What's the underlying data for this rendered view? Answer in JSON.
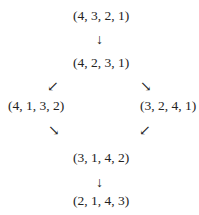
{
  "nodes": {
    "top": "(4, 3, 2, 1)",
    "second": "(4, 2, 3, 1)",
    "left": "(4, 1, 3, 2)",
    "right": "(3, 2, 4, 1)",
    "fifth": "(3, 1, 4, 2)",
    "bottom": "(2, 1, 4, 3)"
  },
  "arrows": {
    "down": "↓",
    "down_left": "↙",
    "down_right": "↘"
  }
}
